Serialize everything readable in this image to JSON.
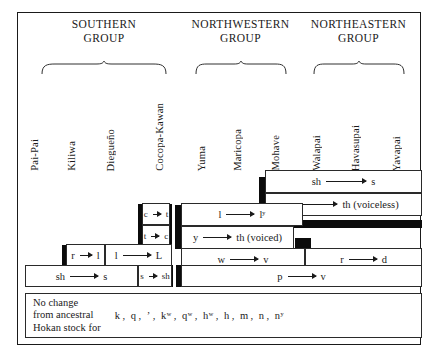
{
  "figure": {
    "groups": [
      {
        "name": "southern-group",
        "label": "SOUTHERN\nGROUP"
      },
      {
        "name": "northwestern-group",
        "label": "NORTHWESTERN\nGROUP"
      },
      {
        "name": "northeastern-group",
        "label": "NORTHEASTERN\nGROUP"
      }
    ],
    "languages": [
      {
        "name": "pai-pai",
        "label": "Pai-Pai"
      },
      {
        "name": "kiliwa",
        "label": "Kiliwa"
      },
      {
        "name": "diegueno",
        "label": "Diegueño"
      },
      {
        "name": "cocopa-kawan",
        "label": "Cocopa-Kawan"
      },
      {
        "name": "yuma",
        "label": "Yuma"
      },
      {
        "name": "maricopa",
        "label": "Maricopa"
      },
      {
        "name": "mohave",
        "label": "Mohave"
      },
      {
        "name": "walapai",
        "label": "Walapai"
      },
      {
        "name": "havasupai",
        "label": "Havasupai"
      },
      {
        "name": "yavapai",
        "label": "Yavapai"
      }
    ],
    "changes": [
      {
        "name": "sh-to-s-northeastern",
        "from": "sh",
        "to": "s"
      },
      {
        "name": "s-to-th-voiceless",
        "from": "s",
        "to": "th (voiceless)"
      },
      {
        "name": "c-to-t",
        "from": "c",
        "to": "t"
      },
      {
        "name": "t-to-c",
        "from": "t",
        "to": "c"
      },
      {
        "name": "l-to-ly",
        "from": "l",
        "to": "lʸ"
      },
      {
        "name": "y-to-th-voiced",
        "from": "y",
        "to": "th (voiced)"
      },
      {
        "name": "r-to-l",
        "from": "r",
        "to": "l"
      },
      {
        "name": "l-to-L",
        "from": "l",
        "to": "L"
      },
      {
        "name": "w-to-v",
        "from": "w",
        "to": "v"
      },
      {
        "name": "r-to-d",
        "from": "r",
        "to": "d"
      },
      {
        "name": "sh-to-s-southern",
        "from": "sh",
        "to": "s"
      },
      {
        "name": "s-to-sh",
        "from": "s",
        "to": "sh"
      },
      {
        "name": "p-to-v",
        "from": "p",
        "to": "v"
      }
    ],
    "no_change": {
      "lead": "No change\nfrom ancestral\nHokan stock for",
      "phonemes": [
        "k",
        "q",
        "ʼ",
        "kʷ",
        "qʷ",
        "hʷ",
        "h",
        "m",
        "n",
        "nʸ"
      ],
      "separator": ","
    }
  },
  "colors": {
    "ink": "#1a1a1a",
    "shadow": "#0b0b0b",
    "paper": "#ffffff"
  }
}
